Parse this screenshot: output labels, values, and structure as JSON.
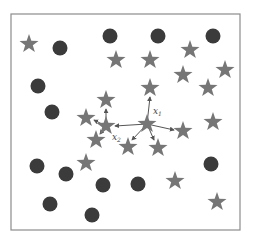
{
  "diagram": {
    "type": "knn-neighborhood-scatter",
    "frame": {
      "x": 11,
      "y": 14,
      "width": 229,
      "height": 216
    },
    "colors": {
      "circle": "#3b3b3b",
      "star": "#767676",
      "arrow": "#555555",
      "frame": "#8c8c8c"
    },
    "circles": [
      {
        "x": 60,
        "y": 48
      },
      {
        "x": 110,
        "y": 36
      },
      {
        "x": 158,
        "y": 36
      },
      {
        "x": 213,
        "y": 36
      },
      {
        "x": 38,
        "y": 86
      },
      {
        "x": 52,
        "y": 112
      },
      {
        "x": 37,
        "y": 166
      },
      {
        "x": 66,
        "y": 174
      },
      {
        "x": 103,
        "y": 185
      },
      {
        "x": 138,
        "y": 184
      },
      {
        "x": 211,
        "y": 164
      },
      {
        "x": 50,
        "y": 204
      },
      {
        "x": 92,
        "y": 215
      }
    ],
    "stars": [
      {
        "x": 29,
        "y": 44
      },
      {
        "x": 116,
        "y": 60
      },
      {
        "x": 150,
        "y": 60
      },
      {
        "x": 190,
        "y": 50
      },
      {
        "x": 225,
        "y": 70
      },
      {
        "x": 183,
        "y": 75
      },
      {
        "x": 208,
        "y": 88
      },
      {
        "x": 106,
        "y": 100
      },
      {
        "x": 150,
        "y": 88
      },
      {
        "x": 86,
        "y": 118
      },
      {
        "x": 147,
        "y": 124
      },
      {
        "x": 183,
        "y": 131
      },
      {
        "x": 213,
        "y": 122
      },
      {
        "x": 106,
        "y": 126
      },
      {
        "x": 96,
        "y": 140
      },
      {
        "x": 128,
        "y": 147
      },
      {
        "x": 158,
        "y": 148
      },
      {
        "x": 86,
        "y": 163
      },
      {
        "x": 175,
        "y": 181
      },
      {
        "x": 217,
        "y": 202
      }
    ],
    "points": {
      "x1": {
        "x": 147,
        "y": 124,
        "label": "x",
        "sub": "1"
      },
      "x2": {
        "x": 106,
        "y": 126,
        "label": "x",
        "sub": "2"
      }
    },
    "arrows": [
      {
        "from": "x1",
        "to": {
          "x": 150,
          "y": 97
        }
      },
      {
        "from": "x1",
        "to": {
          "x": 115,
          "y": 126
        }
      },
      {
        "from": "x1",
        "to": {
          "x": 174,
          "y": 130
        }
      },
      {
        "from": "x1",
        "to": {
          "x": 132,
          "y": 140
        }
      },
      {
        "from": "x1",
        "to": {
          "x": 154,
          "y": 140
        }
      },
      {
        "from": "x2",
        "to": {
          "x": 106,
          "y": 109
        }
      },
      {
        "from": "x2",
        "to": {
          "x": 94,
          "y": 120
        }
      },
      {
        "from": "x2",
        "to": {
          "x": 100,
          "y": 134
        }
      }
    ]
  }
}
